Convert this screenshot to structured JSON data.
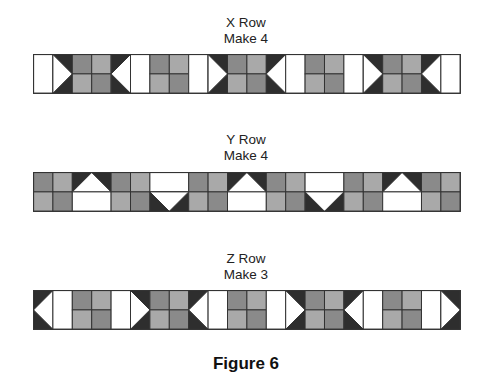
{
  "colors": {
    "white": "#ffffff",
    "dark": "#2e2e2e",
    "gray_dark": "#8a8a8a",
    "gray_light": "#a9a9a9",
    "line": "#333333"
  },
  "rows": [
    {
      "id": "x",
      "title": "X Row",
      "make": "Make 4",
      "height_units": 2,
      "blocks": [
        "white-bar",
        "tri-right",
        "four-patch",
        "tri-left",
        "white-bar",
        "four-patch",
        "white-bar",
        "tri-right",
        "four-patch",
        "tri-left",
        "white-bar",
        "four-patch",
        "white-bar",
        "tri-right",
        "four-patch",
        "tri-left",
        "white-bar"
      ]
    },
    {
      "id": "y",
      "title": "Y Row",
      "make": "Make 4",
      "height_units": 2,
      "blocks": [
        "four-patch",
        "goose-up",
        "four-patch",
        "goose-down",
        "four-patch",
        "goose-up",
        "four-patch",
        "goose-down",
        "four-patch",
        "goose-up",
        "four-patch"
      ]
    },
    {
      "id": "z",
      "title": "Z Row",
      "make": "Make 3",
      "height_units": 2,
      "blocks": [
        "tri-left",
        "white-bar",
        "four-patch",
        "white-bar",
        "tri-right",
        "four-patch",
        "tri-left",
        "white-bar",
        "four-patch",
        "white-bar",
        "tri-right",
        "four-patch",
        "tri-left",
        "white-bar",
        "four-patch",
        "white-bar",
        "tri-right"
      ]
    }
  ],
  "caption": "Figure 6"
}
